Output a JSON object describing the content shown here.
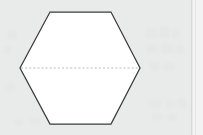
{
  "canvas": {
    "width": 203,
    "height": 135,
    "background_color": "#e9eaea"
  },
  "figure": {
    "caption": "",
    "shape_name": "hexagon",
    "fill_color": "#ffffff",
    "stroke_color": "#3b3b3b",
    "stroke_width": 1.25,
    "vertices": [
      {
        "label": "left",
        "x": 20,
        "y": 68
      },
      {
        "label": "top-left",
        "x": 50,
        "y": 12
      },
      {
        "label": "top-right",
        "x": 111,
        "y": 12
      },
      {
        "label": "right",
        "x": 140,
        "y": 68
      },
      {
        "label": "bottom-right",
        "x": 111,
        "y": 124
      },
      {
        "label": "bottom-left",
        "x": 50,
        "y": 124
      }
    ],
    "points_path": "20,68 50,12 111,12 140,68 111,124 50,124",
    "diagonal": {
      "name": "long-diagonal",
      "style": "dashed",
      "color": "#b9baba",
      "dash_pattern": "2 2.1",
      "x1": 21,
      "y1": 68,
      "x2": 139,
      "y2": 68
    }
  },
  "right_panel": {
    "divider_color": "#d6d7d7",
    "panel_color": "#f3f3f3"
  },
  "ghosts": [
    {
      "x": 8,
      "y": 30,
      "w": 9,
      "h": 9
    },
    {
      "x": 4,
      "y": 46,
      "w": 7,
      "h": 8
    },
    {
      "x": 5,
      "y": 84,
      "w": 10,
      "h": 7
    },
    {
      "x": 146,
      "y": 28,
      "w": 11,
      "h": 10
    },
    {
      "x": 160,
      "y": 27,
      "w": 9,
      "h": 11
    },
    {
      "x": 172,
      "y": 29,
      "w": 8,
      "h": 9
    },
    {
      "x": 147,
      "y": 45,
      "w": 10,
      "h": 8
    },
    {
      "x": 161,
      "y": 44,
      "w": 12,
      "h": 9
    },
    {
      "x": 176,
      "y": 46,
      "w": 7,
      "h": 7
    },
    {
      "x": 150,
      "y": 62,
      "w": 9,
      "h": 8
    },
    {
      "x": 164,
      "y": 63,
      "w": 10,
      "h": 7
    },
    {
      "x": 148,
      "y": 100,
      "w": 13,
      "h": 7
    },
    {
      "x": 165,
      "y": 101,
      "w": 10,
      "h": 6
    },
    {
      "x": 178,
      "y": 99,
      "w": 8,
      "h": 8
    },
    {
      "x": 152,
      "y": 114,
      "w": 11,
      "h": 6
    },
    {
      "x": 168,
      "y": 115,
      "w": 9,
      "h": 6
    },
    {
      "x": 30,
      "y": 118,
      "w": 10,
      "h": 6
    },
    {
      "x": 14,
      "y": 120,
      "w": 9,
      "h": 5
    }
  ]
}
